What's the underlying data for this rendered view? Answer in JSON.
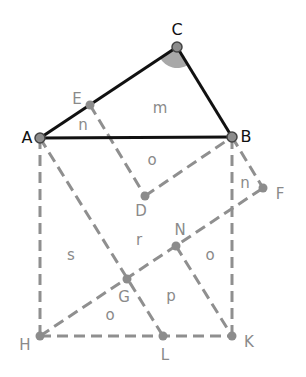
{
  "diagram": {
    "type": "geometry-construction",
    "colors": {
      "solid_line": "#111111",
      "dashed_line": "#8f8f8f",
      "point_fill": "#8c8c8c",
      "angle_fill": "#a8a8a8",
      "dark_label": "#111111",
      "grey_label": "#8a8a8a"
    },
    "points": {
      "A": {
        "label": "A",
        "x": 40,
        "y": 138
      },
      "B": {
        "label": "B",
        "x": 232,
        "y": 137
      },
      "C": {
        "label": "C",
        "x": 177,
        "y": 47
      },
      "E": {
        "label": "E",
        "x": 90,
        "y": 105
      },
      "D": {
        "label": "D",
        "x": 145,
        "y": 196
      },
      "F": {
        "label": "F",
        "x": 263,
        "y": 188
      },
      "N": {
        "label": "N",
        "x": 176,
        "y": 246
      },
      "G": {
        "label": "G",
        "x": 127,
        "y": 279
      },
      "H": {
        "label": "H",
        "x": 40,
        "y": 336
      },
      "L": {
        "label": "L",
        "x": 163,
        "y": 336
      },
      "K": {
        "label": "K",
        "x": 232,
        "y": 336
      }
    },
    "solid_segments": [
      "A-C",
      "C-B",
      "A-B"
    ],
    "dashed_segments": [
      "A-H",
      "H-K",
      "K-B",
      "E-D",
      "D-B",
      "B-F",
      "A-L",
      "H-F",
      "N-K"
    ],
    "angle_marker": {
      "vertex": "C",
      "filled": true
    },
    "region_labels": [
      {
        "text": "m",
        "x": 160,
        "y": 110
      },
      {
        "text": "n",
        "x": 83,
        "y": 127
      },
      {
        "text": "o",
        "x": 152,
        "y": 161
      },
      {
        "text": "n",
        "x": 245,
        "y": 184
      },
      {
        "text": "r",
        "x": 139,
        "y": 240
      },
      {
        "text": "s",
        "x": 71,
        "y": 256
      },
      {
        "text": "o",
        "x": 210,
        "y": 256
      },
      {
        "text": "p",
        "x": 171,
        "y": 297
      },
      {
        "text": "o",
        "x": 110,
        "y": 316
      }
    ]
  }
}
